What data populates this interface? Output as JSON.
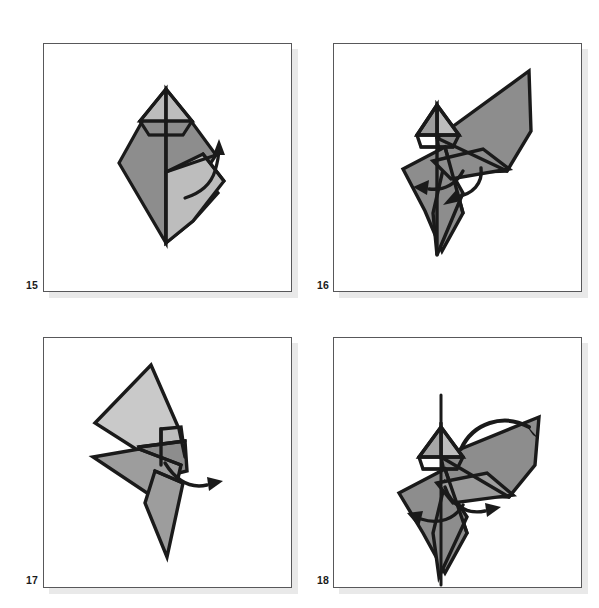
{
  "document": {
    "kind": "origami-instruction-diagram-sheet",
    "layout": "2x2-grid",
    "background_color": "#ffffff"
  },
  "palette": {
    "paper_dark_gray": "#8d8d8d",
    "paper_light_gray": "#bdbdbd",
    "paper_pale_gray": "#c9c9c9",
    "outline_black": "#1a1a1a",
    "frame_border": "#58585a",
    "frame_shadow": "#e9e9e9",
    "label_text": "#1b1b1b"
  },
  "panels": [
    {
      "step_number": "15",
      "label_position": "bottom-left-outside",
      "figure_description": "Upright kite-shaped origami form with small pointed hood at top; left face dark gray, right face light gray, vertical center crease; curved arrow on the right side sweeping upward",
      "arrows": [
        {
          "name": "fold-up-arrow",
          "style": "curved-single-head",
          "direction": "up-right"
        }
      ]
    },
    {
      "step_number": "16",
      "label_position": "bottom-left-outside",
      "figure_description": "Bird-like form with a long wing flap extending to the upper right and a pointed tail to the lower left; small hooded head at center-left; two curved arrows near the center indicating a fold to the left and a fold downward",
      "arrows": [
        {
          "name": "fold-left-arrow",
          "style": "curved-single-head",
          "direction": "left"
        },
        {
          "name": "fold-down-arrow",
          "style": "curved-single-head",
          "direction": "down"
        }
      ]
    },
    {
      "step_number": "17",
      "label_position": "bottom-left-outside",
      "figure_description": "Two stacked narrow diamonds forming a slim vertical zig-zag; upper diamond pale gray, lower diamond mid gray, with a small dark gray overlap panel at the waist; small curved arrow pointing right at the waist",
      "arrows": [
        {
          "name": "fold-right-arrow",
          "style": "curved-single-head",
          "direction": "right"
        }
      ]
    },
    {
      "step_number": "18",
      "label_position": "bottom-left-outside",
      "figure_description": "Bird-like form like step 16 with a vertical spine line drawn through the head and tail; long wing to the upper right, pointed tail down; a large curved arrow arcs over the top to the right and two smaller arrows near the center point left and right",
      "arrows": [
        {
          "name": "turn-over-arrow",
          "style": "curved-single-head-large",
          "direction": "over-to-right"
        },
        {
          "name": "fold-left-arrow",
          "style": "curved-single-head",
          "direction": "left"
        },
        {
          "name": "fold-right-arrow",
          "style": "curved-single-head",
          "direction": "right"
        }
      ]
    }
  ]
}
